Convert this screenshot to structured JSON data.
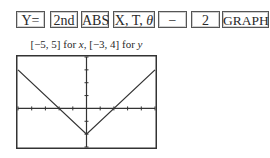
{
  "keystrokes": [
    {
      "label": "Y=",
      "name": "y-equals-key"
    },
    {
      "label": "2nd",
      "name": "2nd-key"
    },
    {
      "label": "ABS",
      "name": "abs-key"
    },
    {
      "label": "X, T, ",
      "italic_suffix": "θ",
      "name": "x-t-theta-key"
    },
    {
      "label": "−",
      "name": "minus-key"
    },
    {
      "label": "2",
      "name": "two-key"
    },
    {
      "label": "GRAPH",
      "name": "graph-key"
    }
  ],
  "caption": {
    "part1": "[−5, 5] for ",
    "var_x": "x",
    "part2": ", [−3, 4] for ",
    "var_y": "y"
  },
  "graph": {
    "function": "y = |x| − 2",
    "window": {
      "xmin": -5,
      "xmax": 5,
      "ymin": -3,
      "ymax": 4,
      "xscl": 1,
      "yscl": 1
    },
    "vertex": [
      0,
      -2
    ],
    "x_intercepts": [
      -2,
      2
    ],
    "colors": {
      "frame": "#333333",
      "axes": "#333333",
      "curve": "#333333"
    }
  }
}
